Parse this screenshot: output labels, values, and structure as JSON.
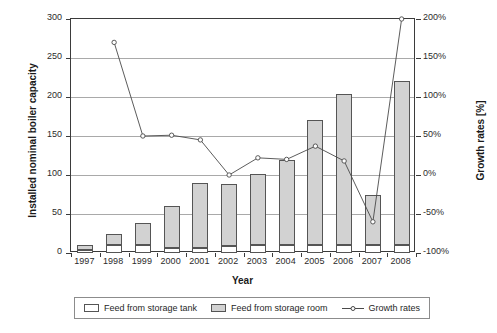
{
  "chart_data": {
    "type": "bar",
    "title": "",
    "xlabel": "Year",
    "ylabel": "Installed nominal boiler capacity",
    "ylabel_unit": "[MW]",
    "ylabel_secondary": "Growth rates [%]",
    "categories": [
      "1997",
      "1998",
      "1999",
      "2000",
      "2001",
      "2002",
      "2003",
      "2004",
      "2005",
      "2006",
      "2007",
      "2008"
    ],
    "ylim": [
      0,
      300
    ],
    "yticks": [
      0,
      50,
      100,
      150,
      200,
      250,
      300
    ],
    "ytick_labels": [
      "0",
      "50",
      "100",
      "150",
      "200",
      "250",
      "300"
    ],
    "ylim_secondary": [
      -100,
      200
    ],
    "yticks_secondary": [
      -100,
      -50,
      0,
      50,
      100,
      150,
      200
    ],
    "ytick_labels_secondary": [
      "-100%",
      "-50%",
      "0%",
      "50%",
      "100%",
      "150%",
      "200%"
    ],
    "grid": true,
    "stacked": true,
    "legend_position": "bottom",
    "series": [
      {
        "name": "Feed from storage tank",
        "type": "bar",
        "color": "#ffffff",
        "values": [
          4,
          10,
          10,
          7,
          7,
          9,
          10,
          10,
          10,
          10,
          10,
          10
        ]
      },
      {
        "name": "Feed from storage room",
        "type": "bar",
        "color": "#d2d2d2",
        "values": [
          6,
          14,
          29,
          53,
          83,
          80,
          91,
          109,
          161,
          194,
          65,
          210
        ]
      },
      {
        "name": "Growth rates",
        "type": "line",
        "color": "#4a4a4a",
        "axis": "secondary",
        "values": [
          null,
          170,
          50,
          51,
          45,
          0,
          22,
          20,
          37,
          18,
          -60,
          200
        ]
      }
    ],
    "totals": [
      10,
      24,
      39,
      60,
      90,
      89,
      101,
      119,
      171,
      204,
      75,
      220
    ]
  },
  "legend": {
    "items": [
      {
        "label": "Feed from storage tank",
        "marker": "white-square-swatch"
      },
      {
        "label": "Feed from storage room",
        "marker": "gray-square-swatch"
      },
      {
        "label": "Growth rates",
        "marker": "line-with-open-circle-marker"
      }
    ]
  }
}
